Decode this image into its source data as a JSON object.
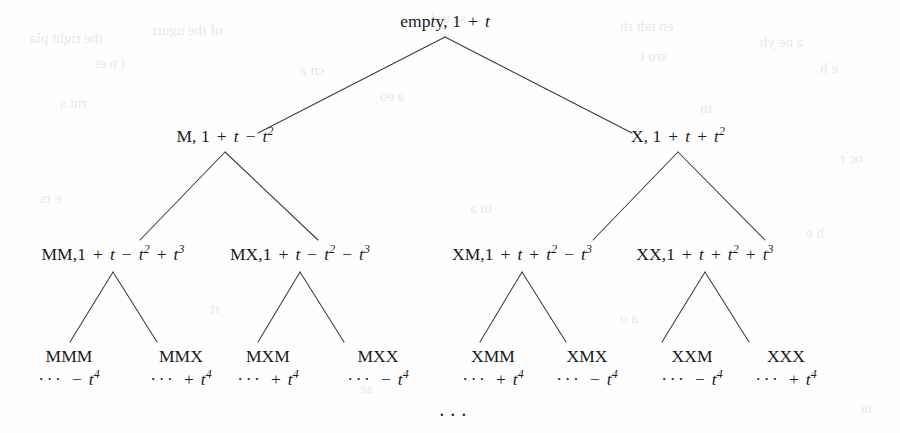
{
  "figure": {
    "bottom_ellipsis": "···",
    "ink_color": "#3b3b3b",
    "background_color": "#fefefe"
  },
  "nodes": {
    "root": {
      "id": "root",
      "word": "empty",
      "separator": ", ",
      "polynomial": "1 + t",
      "label": "empty, 1 + t",
      "x": 445,
      "y": 12
    },
    "level2": [
      {
        "id": "M",
        "word": "M",
        "separator": ", ",
        "polynomial": "1 + t − t²",
        "label": "M, 1 + t − t²",
        "x": 225,
        "y": 127
      },
      {
        "id": "X",
        "word": "X",
        "separator": ", ",
        "polynomial": "1 + t + t²",
        "label": "X, 1 + t + t²",
        "x": 678,
        "y": 127
      }
    ],
    "level3": [
      {
        "id": "MM",
        "word": "MM",
        "separator": ",",
        "polynomial": "1 + t − t² + t³",
        "label": "MM,1 + t − t² + t³",
        "x": 113,
        "y": 245
      },
      {
        "id": "MX",
        "word": "MX",
        "separator": ",",
        "polynomial": "1 + t − t² − t³",
        "label": "MX,1 + t − t² − t³",
        "x": 300,
        "y": 245
      },
      {
        "id": "XM",
        "word": "XM",
        "separator": ",",
        "polynomial": "1 + t + t² − t³",
        "label": "XM,1 + t + t² − t³",
        "x": 522,
        "y": 245
      },
      {
        "id": "XX",
        "word": "XX",
        "separator": ",",
        "polynomial": "1 + t + t² + t³",
        "label": "XX,1 + t + t² + t³",
        "x": 705,
        "y": 245
      }
    ],
    "leaves": [
      {
        "id": "MMM",
        "word": "MMM",
        "tail": "··· − t⁴",
        "sign": "−",
        "term": "t⁴",
        "x": 69,
        "y": 347
      },
      {
        "id": "MMX",
        "word": "MMX",
        "tail": "··· + t⁴",
        "sign": "+",
        "term": "t⁴",
        "x": 181,
        "y": 347
      },
      {
        "id": "MXM",
        "word": "MXM",
        "tail": "··· + t⁴",
        "sign": "+",
        "term": "t⁴",
        "x": 268,
        "y": 347
      },
      {
        "id": "MXX",
        "word": "MXX",
        "tail": "··· − t⁴",
        "sign": "−",
        "term": "t⁴",
        "x": 378,
        "y": 347
      },
      {
        "id": "XMM",
        "word": "XMM",
        "tail": "··· + t⁴",
        "sign": "+",
        "term": "t⁴",
        "x": 493,
        "y": 347
      },
      {
        "id": "XMX",
        "word": "XMX",
        "tail": "··· − t⁴",
        "sign": "−",
        "term": "t⁴",
        "x": 587,
        "y": 347
      },
      {
        "id": "XXM",
        "word": "XXM",
        "tail": "··· − t⁴",
        "sign": "−",
        "term": "t⁴",
        "x": 692,
        "y": 347
      },
      {
        "id": "XXX",
        "word": "XXX",
        "tail": "··· + t⁴",
        "sign": "+",
        "term": "t⁴",
        "x": 786,
        "y": 347
      }
    ]
  },
  "edges": [
    {
      "from": "root",
      "to": "M",
      "x1": 445,
      "y1": 37,
      "x2": 258,
      "y2": 133
    },
    {
      "from": "root",
      "to": "X",
      "x1": 445,
      "y1": 37,
      "x2": 632,
      "y2": 133
    },
    {
      "from": "M",
      "to": "MM",
      "x1": 225,
      "y1": 152,
      "x2": 140,
      "y2": 240
    },
    {
      "from": "M",
      "to": "MX",
      "x1": 225,
      "y1": 152,
      "x2": 318,
      "y2": 240
    },
    {
      "from": "X",
      "to": "XM",
      "x1": 678,
      "y1": 152,
      "x2": 593,
      "y2": 240
    },
    {
      "from": "X",
      "to": "XX",
      "x1": 678,
      "y1": 152,
      "x2": 765,
      "y2": 240
    },
    {
      "from": "MM",
      "to": "MMM",
      "x1": 113,
      "y1": 272,
      "x2": 70,
      "y2": 342
    },
    {
      "from": "MM",
      "to": "MMX",
      "x1": 113,
      "y1": 272,
      "x2": 157,
      "y2": 342
    },
    {
      "from": "MX",
      "to": "MXM",
      "x1": 300,
      "y1": 272,
      "x2": 258,
      "y2": 342
    },
    {
      "from": "MX",
      "to": "MXX",
      "x1": 300,
      "y1": 272,
      "x2": 344,
      "y2": 342
    },
    {
      "from": "XM",
      "to": "XMM",
      "x1": 522,
      "y1": 272,
      "x2": 480,
      "y2": 342
    },
    {
      "from": "XM",
      "to": "XMX",
      "x1": 522,
      "y1": 272,
      "x2": 566,
      "y2": 342
    },
    {
      "from": "XX",
      "to": "XXM",
      "x1": 705,
      "y1": 272,
      "x2": 662,
      "y2": 342
    },
    {
      "from": "XX",
      "to": "XXX",
      "x1": 705,
      "y1": 272,
      "x2": 749,
      "y2": 342
    }
  ],
  "bleed_marks": [
    {
      "text": "the right pla",
      "x": 30,
      "y": 30
    },
    {
      "text": "of the ngurc",
      "x": 150,
      "y": 22
    },
    {
      "text": "sa trcl",
      "x": 430,
      "y": 10
    },
    {
      "text": "en ndt rh",
      "x": 620,
      "y": 18
    },
    {
      "text": "a ne yh",
      "x": 760,
      "y": 34
    },
    {
      "text": "t n et",
      "x": 95,
      "y": 55
    },
    {
      "text": "cn a",
      "x": 300,
      "y": 62
    },
    {
      "text": "sro t",
      "x": 640,
      "y": 48
    },
    {
      "text": "e h",
      "x": 820,
      "y": 60
    },
    {
      "text": "rnt s",
      "x": 60,
      "y": 95
    },
    {
      "text": "a eo",
      "x": 380,
      "y": 88
    },
    {
      "text": "tn",
      "x": 700,
      "y": 100
    },
    {
      "text": "oc r",
      "x": 840,
      "y": 150
    },
    {
      "text": "e rs",
      "x": 40,
      "y": 190
    },
    {
      "text": "tn a",
      "x": 470,
      "y": 200
    },
    {
      "text": "h e",
      "x": 806,
      "y": 225
    },
    {
      "text": "rt",
      "x": 210,
      "y": 300
    },
    {
      "text": "a o",
      "x": 620,
      "y": 310
    },
    {
      "text": "se",
      "x": 360,
      "y": 380
    },
    {
      "text": "nt",
      "x": 860,
      "y": 400
    }
  ]
}
